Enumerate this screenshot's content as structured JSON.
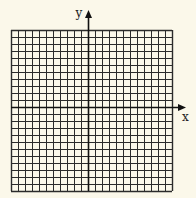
{
  "diagram": {
    "type": "coordinate-grid",
    "columns": 23,
    "rows": 23,
    "cell_size": 7,
    "origin_col": 11,
    "origin_row": 11,
    "grid_left": 11,
    "grid_top": 30,
    "axis_labels": {
      "x": "x",
      "y": "y"
    },
    "colors": {
      "background": "#fbf8ea",
      "grid": "#2b2b2b",
      "axis": "#111111"
    }
  }
}
